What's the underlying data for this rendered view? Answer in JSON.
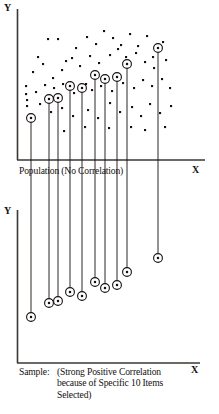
{
  "figure": {
    "title_visible": false,
    "panels": [
      {
        "name": "population-panel",
        "y_axis_label": "Y",
        "x_axis_label": "X",
        "caption": "Population (No Correlation)"
      },
      {
        "name": "sample-panel",
        "y_axis_label": "Y",
        "x_axis_label": "X",
        "caption_label": "Sample:",
        "caption_body": "(Strong Positive Correlation\nbecause of Specific 10 Items\nSelected)"
      }
    ]
  },
  "colors": {
    "ink": "#14100f",
    "axis": "#3a3633",
    "background": "#ffffff"
  },
  "chart_data": {
    "type": "scatter",
    "title": "",
    "xlabel": "X",
    "ylabel": "Y",
    "panels": [
      {
        "id": "population",
        "caption": "Population (No Correlation)",
        "xlim": [
          0,
          219
        ],
        "ylim": [
          0,
          160
        ],
        "grid": false,
        "legend": "none",
        "note": "Dense cloud of uncorrelated population points; 10 selected items are ring-marked and joined to the X axis by vertical drop lines.",
        "selected_points": [
          {
            "x": 31,
            "y": 118
          },
          {
            "x": 49,
            "y": 99
          },
          {
            "x": 58,
            "y": 98
          },
          {
            "x": 70,
            "y": 86
          },
          {
            "x": 82,
            "y": 88
          },
          {
            "x": 95,
            "y": 75
          },
          {
            "x": 105,
            "y": 79
          },
          {
            "x": 117,
            "y": 77
          },
          {
            "x": 127,
            "y": 64
          },
          {
            "x": 158,
            "y": 48
          }
        ],
        "population_points": [
          {
            "x": 38,
            "y": 57
          },
          {
            "x": 48,
            "y": 39
          },
          {
            "x": 58,
            "y": 39
          },
          {
            "x": 66,
            "y": 61
          },
          {
            "x": 76,
            "y": 48
          },
          {
            "x": 87,
            "y": 37
          },
          {
            "x": 96,
            "y": 44
          },
          {
            "x": 104,
            "y": 31
          },
          {
            "x": 113,
            "y": 38
          },
          {
            "x": 121,
            "y": 45
          },
          {
            "x": 130,
            "y": 34
          },
          {
            "x": 138,
            "y": 46
          },
          {
            "x": 147,
            "y": 36
          },
          {
            "x": 153,
            "y": 57
          },
          {
            "x": 163,
            "y": 42
          },
          {
            "x": 33,
            "y": 72
          },
          {
            "x": 43,
            "y": 64
          },
          {
            "x": 53,
            "y": 78
          },
          {
            "x": 62,
            "y": 70
          },
          {
            "x": 72,
            "y": 58
          },
          {
            "x": 80,
            "y": 66
          },
          {
            "x": 90,
            "y": 56
          },
          {
            "x": 99,
            "y": 63
          },
          {
            "x": 110,
            "y": 55
          },
          {
            "x": 118,
            "y": 49
          },
          {
            "x": 126,
            "y": 57
          },
          {
            "x": 136,
            "y": 53
          },
          {
            "x": 145,
            "y": 62
          },
          {
            "x": 154,
            "y": 68
          },
          {
            "x": 166,
            "y": 60
          },
          {
            "x": 26,
            "y": 86
          },
          {
            "x": 26,
            "y": 94
          },
          {
            "x": 27,
            "y": 100
          },
          {
            "x": 27,
            "y": 106
          },
          {
            "x": 36,
            "y": 92
          },
          {
            "x": 45,
            "y": 85
          },
          {
            "x": 54,
            "y": 88
          },
          {
            "x": 63,
            "y": 84
          },
          {
            "x": 74,
            "y": 93
          },
          {
            "x": 86,
            "y": 84
          },
          {
            "x": 92,
            "y": 90
          },
          {
            "x": 101,
            "y": 86
          },
          {
            "x": 112,
            "y": 91
          },
          {
            "x": 123,
            "y": 83
          },
          {
            "x": 134,
            "y": 88
          },
          {
            "x": 143,
            "y": 80
          },
          {
            "x": 152,
            "y": 86
          },
          {
            "x": 162,
            "y": 79
          },
          {
            "x": 170,
            "y": 88
          },
          {
            "x": 40,
            "y": 104
          },
          {
            "x": 51,
            "y": 112
          },
          {
            "x": 62,
            "y": 108
          },
          {
            "x": 73,
            "y": 116
          },
          {
            "x": 88,
            "y": 110
          },
          {
            "x": 98,
            "y": 118
          },
          {
            "x": 110,
            "y": 103
          },
          {
            "x": 120,
            "y": 112
          },
          {
            "x": 132,
            "y": 107
          },
          {
            "x": 141,
            "y": 116
          },
          {
            "x": 150,
            "y": 104
          },
          {
            "x": 160,
            "y": 113
          },
          {
            "x": 171,
            "y": 106
          },
          {
            "x": 109,
            "y": 128
          },
          {
            "x": 131,
            "y": 127
          },
          {
            "x": 145,
            "y": 130
          },
          {
            "x": 165,
            "y": 127
          },
          {
            "x": 85,
            "y": 127
          },
          {
            "x": 64,
            "y": 131
          }
        ]
      },
      {
        "id": "sample",
        "caption": "Sample: (Strong Positive Correlation because of Specific 10 Items Selected)",
        "xlim": [
          0,
          219
        ],
        "ylim": [
          210,
          363
        ],
        "grid": false,
        "legend": "none",
        "note": "Only the 10 ring-marked items are plotted; they rise monotonically left to right, implying strong positive correlation.",
        "selected_points": [
          {
            "x": 31,
            "y": 317
          },
          {
            "x": 49,
            "y": 303
          },
          {
            "x": 58,
            "y": 301
          },
          {
            "x": 70,
            "y": 292
          },
          {
            "x": 82,
            "y": 296
          },
          {
            "x": 95,
            "y": 282
          },
          {
            "x": 105,
            "y": 288
          },
          {
            "x": 117,
            "y": 285
          },
          {
            "x": 127,
            "y": 272
          },
          {
            "x": 158,
            "y": 258
          }
        ]
      }
    ]
  }
}
